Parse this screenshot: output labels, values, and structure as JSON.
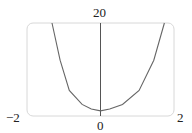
{
  "chart_data": {
    "type": "line",
    "title": "",
    "xlabel": "",
    "ylabel": "",
    "xlim": [
      -2,
      2
    ],
    "ylim": [
      0,
      20
    ],
    "grid": false,
    "x_tick_labels": [
      "-2",
      "0",
      "2"
    ],
    "y_tick_labels": [
      "20"
    ],
    "series": [
      {
        "name": "f(x)",
        "x": [
          -1.32,
          -1.1,
          -0.85,
          -0.5,
          -0.25,
          0,
          0.25,
          0.6,
          1.05,
          1.45,
          1.74
        ],
        "y": [
          20,
          12,
          5.5,
          2.5,
          1.5,
          1.1,
          1.5,
          2.5,
          5.5,
          12,
          20
        ]
      }
    ]
  },
  "labels": {
    "x_min": "−2",
    "x_max": "2",
    "x_origin": "0",
    "y_max": "20"
  },
  "colors": {
    "frame": "#d8d8d8",
    "axis": "#555555",
    "curve": "#666666"
  }
}
